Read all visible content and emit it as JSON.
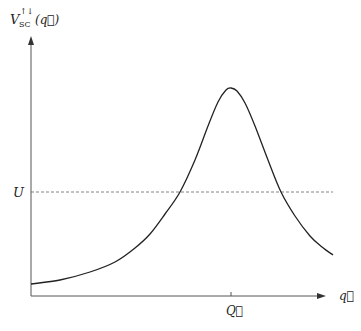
{
  "chart_data": {
    "type": "line",
    "title": "",
    "ylabel": "V_SC^{↑↓}(q⃗)",
    "ylabel_parts": {
      "base": "V",
      "sup": "↑↓",
      "sub": "SC",
      "arg": "(q⃗)"
    },
    "xlabel": "q⃗",
    "x_tick_label": "Q⃗",
    "reference_line": {
      "label": "U",
      "style": "dashed"
    },
    "curve_points_px": [
      [
        31,
        284
      ],
      [
        60,
        280
      ],
      [
        90,
        272
      ],
      [
        115,
        262
      ],
      [
        135,
        248
      ],
      [
        150,
        234
      ],
      [
        165,
        214
      ],
      [
        180,
        192
      ],
      [
        195,
        160
      ],
      [
        208,
        126
      ],
      [
        218,
        102
      ],
      [
        226,
        90
      ],
      [
        231,
        88
      ],
      [
        237,
        91
      ],
      [
        245,
        103
      ],
      [
        255,
        126
      ],
      [
        268,
        160
      ],
      [
        281,
        192
      ],
      [
        295,
        216
      ],
      [
        310,
        236
      ],
      [
        322,
        247
      ],
      [
        333,
        255
      ]
    ],
    "peak": {
      "x_label": "Q⃗"
    },
    "grid": false,
    "legend": null
  },
  "axes": {
    "origin_px": [
      31,
      296
    ],
    "x_end_px": 325,
    "y_top_px": 36,
    "u_level_px": 192,
    "q_tick_px": 231
  },
  "colors": {
    "axis": "#555555",
    "curve": "#222222",
    "dashed": "#666666",
    "text": "#222222"
  }
}
